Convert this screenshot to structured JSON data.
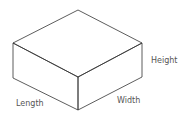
{
  "diagram": {
    "labels": {
      "length": "Length",
      "width": "Width",
      "height": "Height"
    },
    "colors": {
      "stroke": "#333333",
      "text": "#555555",
      "background": "#ffffff"
    }
  }
}
